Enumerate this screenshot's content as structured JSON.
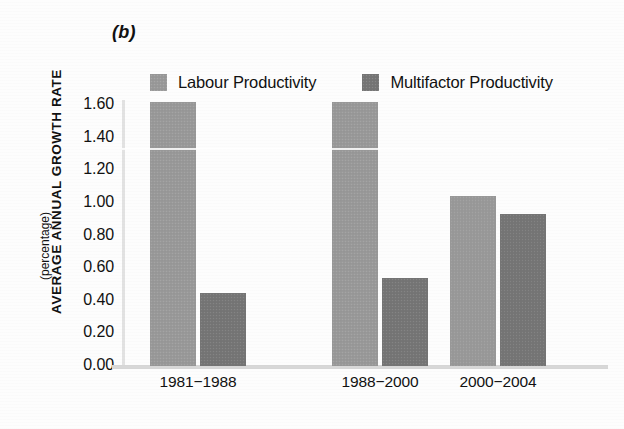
{
  "figure": {
    "panel_label": "(b)",
    "y_axis_title": "AVERAGE ANNUAL GROWTH RATE",
    "y_axis_subtitle": "(percentage)"
  },
  "legend": {
    "items": [
      {
        "label": "Labour Productivity",
        "color": "#9a9a9a",
        "swatch": "legend-swatch-light"
      },
      {
        "label": "Multifactor Productivity",
        "color": "#767676",
        "swatch": "legend-swatch-dark"
      }
    ]
  },
  "chart_data": {
    "type": "bar",
    "title": "(b)",
    "xlabel": "",
    "ylabel": "AVERAGE ANNUAL GROWTH RATE (percentage)",
    "categories": [
      "1981−1988",
      "1988−2000",
      "2000−2004"
    ],
    "series": [
      {
        "name": "Labour Productivity",
        "color": "#9a9a9a",
        "values": [
          1.62,
          1.62,
          1.04
        ]
      },
      {
        "name": "Multifactor Productivity",
        "color": "#767676",
        "values": [
          0.45,
          0.54,
          0.93
        ]
      }
    ],
    "ylim": [
      0.0,
      1.6
    ],
    "ytick_step": 0.2,
    "ytick_labels": [
      "1.60",
      "1.40",
      "1.20",
      "1.00",
      "0.80",
      "0.60",
      "0.40",
      "0.20",
      "0.00"
    ],
    "ytick_values": [
      1.6,
      1.4,
      1.2,
      1.0,
      0.8,
      0.6,
      0.4,
      0.2,
      0.0
    ],
    "grid": false,
    "legend_position": "top"
  }
}
